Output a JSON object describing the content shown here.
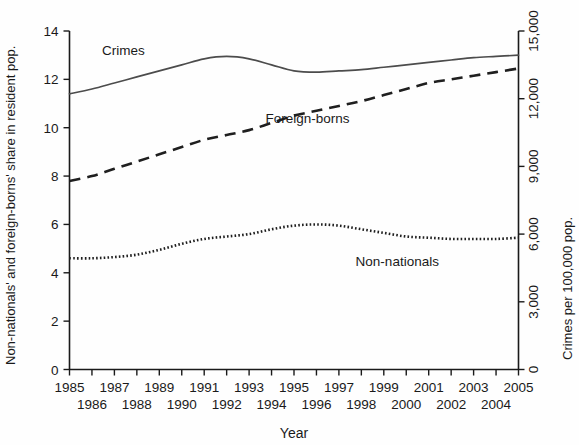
{
  "chart_data": {
    "type": "line",
    "title": "",
    "xlabel": "Year",
    "ylabel": "Non-nationals' and foreign-borns' share in resident pop.",
    "ylabel_right": "Crimes per 100,000 pop.",
    "grid": false,
    "legend": "inline-annotations",
    "xlim": [
      1985,
      2005
    ],
    "ylim": [
      0,
      14
    ],
    "ylim_right": [
      0,
      15000
    ],
    "x": [
      1985,
      1986,
      1987,
      1988,
      1989,
      1990,
      1991,
      1992,
      1993,
      1994,
      1995,
      1996,
      1997,
      1998,
      1999,
      2000,
      2001,
      2002,
      2003,
      2004,
      2005
    ],
    "xticklabels_row1": [
      "1985",
      "1987",
      "1989",
      "1991",
      "1993",
      "1995",
      "1997",
      "1999",
      "2001",
      "2003",
      "2005"
    ],
    "xticklabels_row2": [
      "1986",
      "1988",
      "1990",
      "1992",
      "1994",
      "1996",
      "1998",
      "2000",
      "2002",
      "2004"
    ],
    "yticklabels_left": [
      "0",
      "2",
      "4",
      "6",
      "8",
      "10",
      "12",
      "14"
    ],
    "yticks_left": [
      0,
      2,
      4,
      6,
      8,
      10,
      12,
      14
    ],
    "yticklabels_right": [
      "0",
      "3,000",
      "6,000",
      "9,000",
      "12,000",
      "15,000"
    ],
    "yticks_right": [
      0,
      3000,
      6000,
      9000,
      12000,
      15000
    ],
    "series": [
      {
        "name": "Crimes",
        "axis": "right",
        "style": "solid",
        "color": "#4c4c4c",
        "label_text": "Crimes",
        "values_left_scale": [
          11.4,
          11.6,
          11.85,
          12.1,
          12.35,
          12.6,
          12.85,
          12.95,
          12.85,
          12.6,
          12.35,
          12.3,
          12.35,
          12.4,
          12.5,
          12.6,
          12.7,
          12.8,
          12.9,
          12.95,
          13.0
        ],
        "values": [
          12214,
          12429,
          12696,
          12964,
          13232,
          13500,
          13768,
          13875,
          13768,
          13500,
          13232,
          13179,
          13232,
          13286,
          13393,
          13500,
          13607,
          13714,
          13821,
          13875,
          13929
        ]
      },
      {
        "name": "Foreign-borns",
        "axis": "left",
        "style": "dashed",
        "color": "#1f1f1f",
        "label_text": "Foreign-borns",
        "values": [
          7.8,
          8.0,
          8.3,
          8.6,
          8.9,
          9.2,
          9.5,
          9.7,
          9.9,
          10.2,
          10.5,
          10.7,
          10.9,
          11.1,
          11.35,
          11.6,
          11.85,
          12.0,
          12.15,
          12.3,
          12.45
        ]
      },
      {
        "name": "Non-nationals",
        "axis": "left",
        "style": "dotted",
        "color": "#1f1f1f",
        "label_text": "Non-nationals",
        "values": [
          4.6,
          4.6,
          4.65,
          4.75,
          4.95,
          5.2,
          5.4,
          5.5,
          5.6,
          5.8,
          5.95,
          6.0,
          5.95,
          5.8,
          5.65,
          5.5,
          5.45,
          5.4,
          5.4,
          5.4,
          5.45
        ]
      }
    ],
    "annotations": [
      {
        "text": "Crimes",
        "x": 1987.4,
        "y_left": 13.0
      },
      {
        "text": "Foreign-borns",
        "x": 1995.6,
        "y_left": 10.2
      },
      {
        "text": "Non-nationals",
        "x": 1999.6,
        "y_left": 4.3
      }
    ]
  }
}
